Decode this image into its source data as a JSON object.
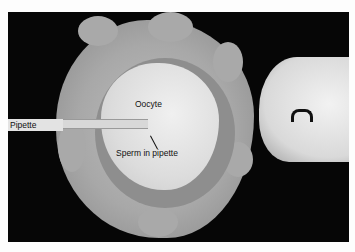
{
  "figure": {
    "labels": {
      "oocyte": "Oocyte",
      "pipette": "Pipette",
      "sperm": "Sperm in pipette"
    },
    "colors": {
      "background": "#060606",
      "page": "#fdfdfd",
      "label_text": "#111111"
    }
  }
}
